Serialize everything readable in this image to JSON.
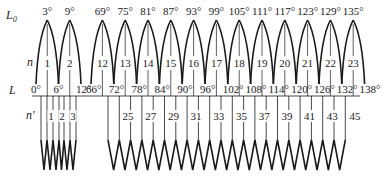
{
  "row_labels": {
    "l0": "L",
    "l0_sub": "0",
    "n": "n",
    "l": "L",
    "n_prime": "n′"
  },
  "upper": {
    "group1": {
      "peaks": [
        "3°",
        "9°"
      ],
      "bottoms": [
        "0°",
        "6°",
        "12°"
      ],
      "n": [
        "1",
        "2"
      ]
    },
    "group2": {
      "peaks": [
        "69°",
        "75°",
        "81°",
        "87°",
        "93°",
        "99°",
        "105°",
        "111°",
        "117°",
        "123°",
        "129°",
        "135°"
      ],
      "bottoms": [
        "66°",
        "72°",
        "78°",
        "84°",
        "90°",
        "96°",
        "102°",
        "108°",
        "114°",
        "120°",
        "126°",
        "132°",
        "138°"
      ],
      "n": [
        "12",
        "13",
        "14",
        "15",
        "16",
        "17",
        "18",
        "19",
        "20",
        "21",
        "22",
        "23"
      ]
    }
  },
  "lower": {
    "group1_n_prime": [
      "1",
      "2",
      "3"
    ],
    "group2_n_prime": [
      "25",
      "27",
      "29",
      "31",
      "33",
      "35",
      "37",
      "39",
      "41",
      "43",
      "45"
    ]
  },
  "colors": {
    "stroke": "#1a1a1a",
    "background": "#ffffff"
  }
}
